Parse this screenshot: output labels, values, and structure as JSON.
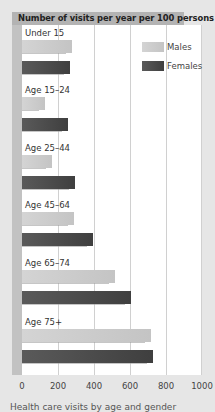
{
  "chart_data": {
    "type": "bar",
    "orientation": "horizontal",
    "title": "Number of visits per year per 100 persons",
    "categories": [
      "Under 15",
      "Age 15–24",
      "Age 25–44",
      "Age 45–64",
      "Age 65–74",
      "Age 75+"
    ],
    "series": [
      {
        "name": "Males",
        "color": "#cccccc",
        "values": [
          278,
          128,
          167,
          290,
          515,
          715
        ]
      },
      {
        "name": "Females",
        "color": "#4a4a4a",
        "values": [
          267,
          255,
          295,
          395,
          605,
          730
        ]
      }
    ],
    "xlabel": "",
    "ylabel": "",
    "xlim": [
      0,
      1000
    ],
    "xticks": [
      "0",
      "200",
      "400",
      "600",
      "800",
      "1000"
    ],
    "grid": true,
    "legend_position": "top-right"
  },
  "legend": {
    "males": "Males",
    "females": "Females"
  },
  "caption": "Health care visits by age and gender"
}
